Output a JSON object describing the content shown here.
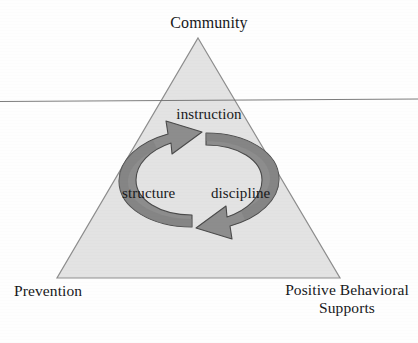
{
  "figure": {
    "type": "triangle-cycle-diagram",
    "background_color": "#fefefe",
    "triangle": {
      "fill_color": "#e3e3e3",
      "stroke_color": "#8d8d8d",
      "apex_label": "Community",
      "bottom_left_label": "Prevention",
      "bottom_right_label_line1": "Positive Behavioral",
      "bottom_right_label_line2": "Supports"
    },
    "cycle": {
      "arrow_fill_color": "#8d8d8d",
      "arrow_stroke_color": "#4a4a4a",
      "top_label": "instruction",
      "left_label": "structure",
      "right_label": "discipline"
    },
    "scan_line": {
      "color": "#6e6e6e",
      "description": "horizontal scanner artifact line"
    }
  }
}
